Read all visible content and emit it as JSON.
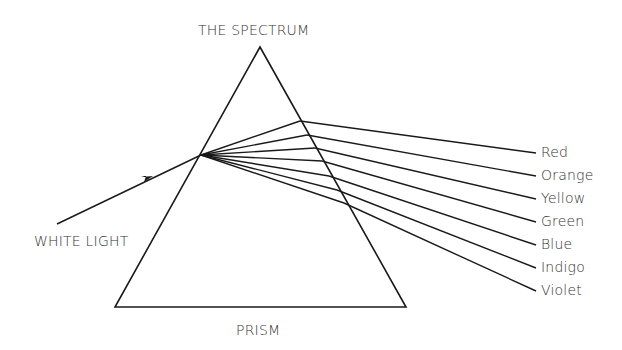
{
  "diagram": {
    "title": "THE SPECTRUM",
    "input_label": "WHITE LIGHT",
    "prism_label": "PRISM",
    "colors": [
      {
        "name": "Red"
      },
      {
        "name": "Orange"
      },
      {
        "name": "Yellow"
      },
      {
        "name": "Green"
      },
      {
        "name": "Blue"
      },
      {
        "name": "Indigo"
      },
      {
        "name": "Violet"
      }
    ],
    "line_color": "#1a1a1a"
  }
}
